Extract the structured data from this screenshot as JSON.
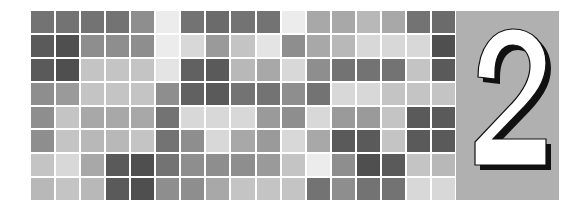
{
  "banner": {
    "kind": "chapter-opener-banner",
    "background_color": "#ffffff",
    "width": 588,
    "height": 216
  },
  "numeral": {
    "label": "2",
    "panel_color": "#b0b0b0",
    "fill_color": "#ffffff",
    "shadow_color": "#111111",
    "outline_color": "#111111"
  },
  "mosaic": {
    "rows": 8,
    "columns": 17,
    "gap_color": "#ffffff",
    "palette": {
      "darkest": "#4f4f4f",
      "dark": "#616161",
      "mid_dark": "#737373",
      "mid": "#8e8e8e",
      "mid_light": "#a8a8a8",
      "light": "#c4c4c4",
      "lighter": "#d8d8d8",
      "lightest": "#ececec"
    },
    "grid": [
      [
        "#737373",
        "#737373",
        "#737373",
        "#737373",
        "#8e8e8e",
        "#ececec",
        "#737373",
        "#6b6b6b",
        "#737373",
        "#737373",
        "#ececec",
        "#a8a8a8",
        "#a8a8a8",
        "#b8b8b8",
        "#a8a8a8",
        "#737373",
        "#6b6b6b"
      ],
      [
        "#5a5a5a",
        "#4f4f4f",
        "#8e8e8e",
        "#8e8e8e",
        "#8e8e8e",
        "#ececec",
        "#d8d8d8",
        "#9a9a9a",
        "#c4c4c4",
        "#e4e4e4",
        "#8e8e8e",
        "#a8a8a8",
        "#b8b8b8",
        "#d8d8d8",
        "#d8d8d8",
        "#d8d8d8",
        "#4f4f4f"
      ],
      [
        "#5a5a5a",
        "#4f4f4f",
        "#c4c4c4",
        "#c4c4c4",
        "#c4c4c4",
        "#e4e4e4",
        "#616161",
        "#5a5a5a",
        "#b8b8b8",
        "#a8a8a8",
        "#d8d8d8",
        "#8e8e8e",
        "#737373",
        "#737373",
        "#737373",
        "#c4c4c4",
        "#5a5a5a"
      ],
      [
        "#8e8e8e",
        "#9a9a9a",
        "#c4c4c4",
        "#c4c4c4",
        "#c4c4c4",
        "#8e8e8e",
        "#616161",
        "#5a5a5a",
        "#737373",
        "#737373",
        "#8e8e8e",
        "#737373",
        "#d8d8d8",
        "#d8d8d8",
        "#c4c4c4",
        "#c4c4c4",
        "#c4c4c4"
      ],
      [
        "#8e8e8e",
        "#c4c4c4",
        "#a8a8a8",
        "#a8a8a8",
        "#a8a8a8",
        "#737373",
        "#d8d8d8",
        "#d8d8d8",
        "#d8d8d8",
        "#9a9a9a",
        "#8e8e8e",
        "#d8d8d8",
        "#9a9a9a",
        "#9a9a9a",
        "#c4c4c4",
        "#5a5a5a",
        "#5a5a5a"
      ],
      [
        "#8e8e8e",
        "#c4c4c4",
        "#b8b8b8",
        "#b8b8b8",
        "#c4c4c4",
        "#737373",
        "#8e8e8e",
        "#d8d8d8",
        "#a8a8a8",
        "#9a9a9a",
        "#d8d8d8",
        "#a8a8a8",
        "#5a5a5a",
        "#5a5a5a",
        "#c4c4c4",
        "#5a5a5a",
        "#5a5a5a"
      ],
      [
        "#c4c4c4",
        "#d8d8d8",
        "#a8a8a8",
        "#5a5a5a",
        "#4f4f4f",
        "#737373",
        "#8e8e8e",
        "#8e8e8e",
        "#8e8e8e",
        "#9a9a9a",
        "#c4c4c4",
        "#ececec",
        "#8e8e8e",
        "#4f4f4f",
        "#5a5a5a",
        "#c4c4c4",
        "#b8b8b8"
      ],
      [
        "#b8b8b8",
        "#c4c4c4",
        "#b8b8b8",
        "#5a5a5a",
        "#4f4f4f",
        "#8e8e8e",
        "#8e8e8e",
        "#a8a8a8",
        "#c4c4c4",
        "#c4c4c4",
        "#c4c4c4",
        "#737373",
        "#8e8e8e",
        "#737373",
        "#737373",
        "#d8d8d8",
        "#d8d8d8"
      ]
    ]
  }
}
